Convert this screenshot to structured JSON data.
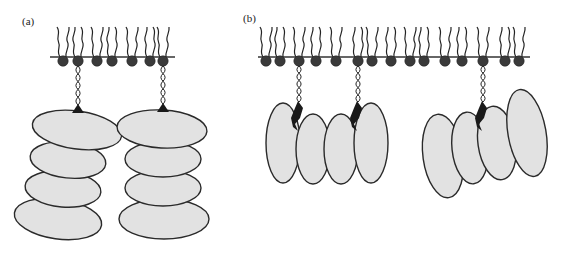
{
  "figure": {
    "panels": [
      {
        "id": "a",
        "label": "(a)",
        "description": "Lipid-anchored proteins with stacked oligomeric subunits",
        "membrane": {
          "x1": 50,
          "x2": 175,
          "y": 57
        },
        "lipid_heads_x": [
          63,
          78,
          97,
          112,
          132,
          150,
          163
        ],
        "anchored_heads_x": [
          78,
          163
        ],
        "proteins": [
          {
            "anchor_x": 78,
            "subunits": [
              {
                "cx": 77,
                "cy": 130,
                "rx": 45,
                "ry": 19,
                "rot": 8
              },
              {
                "cx": 68,
                "cy": 160,
                "rx": 38,
                "ry": 18,
                "rot": 6
              },
              {
                "cx": 63,
                "cy": 189,
                "rx": 38,
                "ry": 18,
                "rot": 5
              },
              {
                "cx": 58,
                "cy": 219,
                "rx": 44,
                "ry": 20,
                "rot": 8
              }
            ]
          },
          {
            "anchor_x": 163,
            "subunits": [
              {
                "cx": 162,
                "cy": 129,
                "rx": 45,
                "ry": 19,
                "rot": 3
              },
              {
                "cx": 163,
                "cy": 159,
                "rx": 38,
                "ry": 18,
                "rot": 0
              },
              {
                "cx": 163,
                "cy": 188,
                "rx": 38,
                "ry": 18,
                "rot": 0
              },
              {
                "cx": 164,
                "cy": 219,
                "rx": 45,
                "ry": 20,
                "rot": 0
              }
            ]
          }
        ]
      },
      {
        "id": "b",
        "label": "(b)",
        "description": "Lipid-anchored proteins with side-by-side subunits",
        "membrane": {
          "x1": 258,
          "x2": 530,
          "y": 57
        },
        "lipid_heads_x": [
          266,
          280,
          299,
          316,
          336,
          358,
          372,
          391,
          410,
          424,
          445,
          462,
          483,
          505,
          519
        ],
        "anchored_heads_x": [
          299,
          358,
          483
        ],
        "proteins": [
          {
            "anchor_x": 299,
            "subunits": [
              {
                "cx": 283,
                "cy": 143,
                "rx": 17,
                "ry": 40,
                "rot": 0
              },
              {
                "cx": 313,
                "cy": 149,
                "rx": 17,
                "ry": 35,
                "rot": 0
              },
              {
                "cx": 341,
                "cy": 149,
                "rx": 17,
                "ry": 35,
                "rot": 0
              },
              {
                "cx": 371,
                "cy": 143,
                "rx": 17,
                "ry": 40,
                "rot": 0
              }
            ]
          },
          {
            "anchor_x": 483,
            "subunits": [
              {
                "cx": 443,
                "cy": 156,
                "rx": 20,
                "ry": 42,
                "rot": -8
              },
              {
                "cx": 470,
                "cy": 148,
                "rx": 18,
                "ry": 36,
                "rot": -6
              },
              {
                "cx": 497,
                "cy": 143,
                "rx": 19,
                "ry": 37,
                "rot": -8
              },
              {
                "cx": 527,
                "cy": 133,
                "rx": 19,
                "ry": 44,
                "rot": -10
              }
            ]
          }
        ]
      }
    ],
    "colors": {
      "membrane": "#333333",
      "lipid_head": "#3a3a3a",
      "protein_subunit": "#e2e2e2",
      "outline": "#2a2a2a",
      "anchor": "#1a1a1a"
    }
  }
}
